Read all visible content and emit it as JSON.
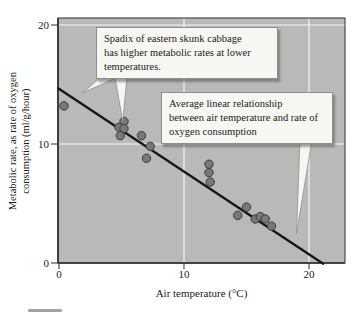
{
  "chart_data": {
    "type": "scatter",
    "title": "",
    "xlabel": "Air temperature (°C)",
    "ylabel": "Metabolic rate, as rate of oxygen consumption (ml/g/hour)",
    "ylabel_lines": [
      "Metabolic rate, as rate of oxygen",
      "consumption (ml/g/hour)"
    ],
    "xlim": [
      0,
      22.9
    ],
    "ylim": [
      0,
      20.6
    ],
    "x_ticks": [
      0,
      10,
      20
    ],
    "y_ticks": [
      0,
      10,
      20
    ],
    "grid": true,
    "gridlines": {
      "x": [
        10,
        20
      ],
      "y": [
        10,
        20
      ]
    },
    "legend": "none",
    "points": [
      {
        "x": 0.4,
        "y": 13.2
      },
      {
        "x": 5.2,
        "y": 11.9
      },
      {
        "x": 4.8,
        "y": 11.4
      },
      {
        "x": 5.2,
        "y": 11.3
      },
      {
        "x": 4.9,
        "y": 10.7
      },
      {
        "x": 6.6,
        "y": 10.7
      },
      {
        "x": 7.3,
        "y": 9.8
      },
      {
        "x": 7.0,
        "y": 8.8
      },
      {
        "x": 12.0,
        "y": 8.3
      },
      {
        "x": 12.0,
        "y": 7.6
      },
      {
        "x": 12.1,
        "y": 6.8
      },
      {
        "x": 15.0,
        "y": 4.7
      },
      {
        "x": 14.3,
        "y": 4.0
      },
      {
        "x": 15.7,
        "y": 3.7
      },
      {
        "x": 16.1,
        "y": 3.9
      },
      {
        "x": 16.5,
        "y": 3.7
      },
      {
        "x": 17.0,
        "y": 3.1
      }
    ],
    "trend_line": {
      "x1": -0.1,
      "y1": 14.7,
      "x2": 21.2,
      "y2": -0.1
    },
    "annotations": [
      {
        "text": "Spadix of eastern skunk cabbage\nhas higher metabolic rates at lower\ntemperatures.",
        "points_to": [
          {
            "x": 1.9,
            "y": 14.3
          },
          {
            "x": 5.1,
            "y": 11.9
          }
        ]
      },
      {
        "text": "Average linear relationship\nbetween air temperature and rate of\noxygen consumption",
        "points_to": [
          {
            "x": 19.0,
            "y": 2.5
          }
        ]
      }
    ],
    "colors": {
      "plot_bg": "#b9b9b9",
      "grid": "#f5f5f2",
      "axis": "#2e2e2e",
      "point_fill": "#787878",
      "point_stroke": "#3a3a3a",
      "trend": "#151515",
      "callout_bg": "#f6f6f2",
      "callout_border": "#8f8f8f",
      "text": "#1b1b1b"
    }
  }
}
